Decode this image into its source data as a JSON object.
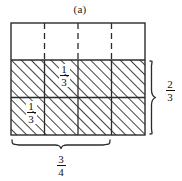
{
  "figure": {
    "caption": "(a)",
    "grid": {
      "columns": 4,
      "rows": 3,
      "shaded_rows": 2,
      "unshaded_rows": 1,
      "shading_style": "diagonal-hatch",
      "top_row_divider_style": "dashed",
      "shaded_row_divider_style": "solid",
      "border_color": "#2b2b2b",
      "hatch_color": "#3a3a3a",
      "background_color": "#ffffff"
    },
    "cell_labels": [
      {
        "name": "middle-row-cell-fraction",
        "row": 2,
        "column": 2,
        "numerator": "1",
        "denominator": "3"
      },
      {
        "name": "bottom-row-cell-fraction",
        "row": 3,
        "column": 1,
        "numerator": "1",
        "denominator": "3"
      }
    ],
    "braces": [
      {
        "name": "right-brace",
        "orientation": "vertical",
        "spans": "shaded rows",
        "numerator": "2",
        "denominator": "3"
      },
      {
        "name": "bottom-brace",
        "orientation": "horizontal",
        "spans": "columns 1-3",
        "numerator": "3",
        "denominator": "4"
      }
    ]
  }
}
